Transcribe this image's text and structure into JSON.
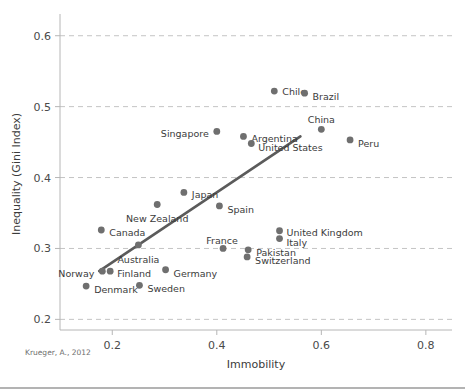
{
  "chart_data": {
    "type": "scatter",
    "title": "",
    "xlabel": "Immobility",
    "ylabel": "Inequality (Gini Index)",
    "xlim": [
      0.1,
      0.85
    ],
    "ylim": [
      0.185,
      0.625
    ],
    "xticks": [
      0.2,
      0.4,
      0.6,
      0.8
    ],
    "xticklabels": [
      "0.2",
      "0.4",
      "0.6",
      "0.8"
    ],
    "yticks": [
      0.2,
      0.3,
      0.4,
      0.5,
      0.6
    ],
    "yticklabels": [
      "0.2",
      "0.3",
      "0.4",
      "0.5",
      "0.6"
    ],
    "grid": "horizontal-dashed",
    "legend": "none",
    "marker_color": "#6f6f6f",
    "trendline_color": "#5b5b5b",
    "points": [
      {
        "label": "Denmark",
        "x": 0.15,
        "y": 0.247,
        "lx": 8,
        "ly": 4
      },
      {
        "label": "Norway",
        "x": 0.181,
        "y": 0.268,
        "lx": -8,
        "ly": 3,
        "anchor": "end"
      },
      {
        "label": "Finland",
        "x": 0.196,
        "y": 0.268,
        "lx": 7,
        "ly": 3
      },
      {
        "label": "Sweden",
        "x": 0.252,
        "y": 0.248,
        "lx": 8,
        "ly": 4
      },
      {
        "label": "Canada",
        "x": 0.179,
        "y": 0.326,
        "lx": 8,
        "ly": 3
      },
      {
        "label": "Australia",
        "x": 0.25,
        "y": 0.305,
        "lx": 0,
        "ly": 15,
        "anchor": "middle"
      },
      {
        "label": "Germany",
        "x": 0.302,
        "y": 0.27,
        "lx": 8,
        "ly": 4
      },
      {
        "label": "New Zealand",
        "x": 0.286,
        "y": 0.362,
        "lx": 0,
        "ly": 15,
        "anchor": "middle"
      },
      {
        "label": "Japan",
        "x": 0.337,
        "y": 0.379,
        "lx": 8,
        "ly": 3
      },
      {
        "label": "Spain",
        "x": 0.405,
        "y": 0.36,
        "lx": 8,
        "ly": 4
      },
      {
        "label": "France",
        "x": 0.412,
        "y": 0.3,
        "lx": -1,
        "ly": -7,
        "anchor": "middle"
      },
      {
        "label": "Pakistan",
        "x": 0.46,
        "y": 0.298,
        "lx": 8,
        "ly": 3
      },
      {
        "label": "Switzerland",
        "x": 0.458,
        "y": 0.288,
        "lx": 8,
        "ly": 4
      },
      {
        "label": "United Kingdom",
        "x": 0.52,
        "y": 0.325,
        "lx": 7,
        "ly": 2
      },
      {
        "label": "Italy",
        "x": 0.52,
        "y": 0.314,
        "lx": 7,
        "ly": 4
      },
      {
        "label": "Singapore",
        "x": 0.4,
        "y": 0.465,
        "lx": -8,
        "ly": 3,
        "anchor": "end"
      },
      {
        "label": "Argentina",
        "x": 0.451,
        "y": 0.458,
        "lx": 8,
        "ly": 3
      },
      {
        "label": "United States",
        "x": 0.466,
        "y": 0.448,
        "lx": 7,
        "ly": 4
      },
      {
        "label": "Chile",
        "x": 0.51,
        "y": 0.522,
        "lx": 8,
        "ly": 1
      },
      {
        "label": "Brazil",
        "x": 0.568,
        "y": 0.519,
        "lx": 8,
        "ly": 4
      },
      {
        "label": "China",
        "x": 0.6,
        "y": 0.468,
        "lx": 0,
        "ly": -9,
        "anchor": "middle"
      },
      {
        "label": "Peru",
        "x": 0.655,
        "y": 0.453,
        "lx": 8,
        "ly": 4
      }
    ],
    "trendline": {
      "x1": 0.175,
      "y1": 0.268,
      "x2": 0.56,
      "y2": 0.458
    }
  },
  "footer": {
    "source": "Krueger, A., 2012"
  }
}
